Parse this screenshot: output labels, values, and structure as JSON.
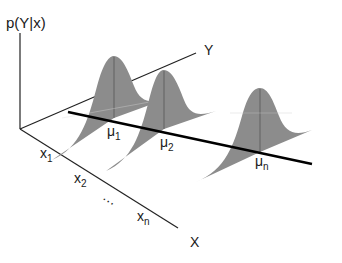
{
  "diagram": {
    "axes": {
      "vertical_label": "p(Y|x)",
      "y_label": "Y",
      "x_label": "X"
    },
    "x_ticks": [
      {
        "main": "x",
        "sub": "1"
      },
      {
        "main": "x",
        "sub": "2"
      },
      {
        "main": "…",
        "sub": ""
      },
      {
        "main": "x",
        "sub": "n"
      }
    ],
    "means": [
      {
        "main": "μ",
        "sub": "1"
      },
      {
        "main": "μ",
        "sub": "2"
      },
      {
        "main": "μ",
        "sub": "n"
      }
    ],
    "colors": {
      "curve_fill": "#8c8c8c",
      "axis": "#222222",
      "regression_line": "#000000",
      "background": "#ffffff"
    }
  }
}
